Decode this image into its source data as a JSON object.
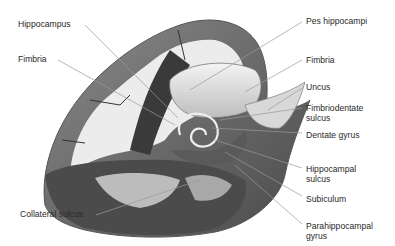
{
  "figure": {
    "colors": {
      "gray_matter": "#6f6f6f",
      "dark_matter": "#3a3a3a",
      "white_matter": "#e6e6e6",
      "leader_line": "#9a9a9a",
      "label_text": "#2a2a2a"
    },
    "labels_left": [
      {
        "id": "hippocampus",
        "text": "Hippocampus"
      },
      {
        "id": "fimbria-left",
        "text": "Fimbria"
      },
      {
        "id": "collateral-sulcus",
        "text": "Collateral sulcus"
      }
    ],
    "labels_right": [
      {
        "id": "pes-hippocampi",
        "text": "Pes hippocampi"
      },
      {
        "id": "fimbria-right",
        "text": "Fimbria"
      },
      {
        "id": "uncus",
        "text": "Uncus"
      },
      {
        "id": "fimbriodentate-sulcus",
        "text": "Fimbriodentate\nsulcus"
      },
      {
        "id": "dentate-gyrus",
        "text": "Dentate gyrus"
      },
      {
        "id": "hippocampal-sulcus",
        "text": "Hippocampal\nsulcus"
      },
      {
        "id": "subiculum",
        "text": "Subiculum"
      },
      {
        "id": "parahippocampal-gyrus",
        "text": "Parahippocampal\ngyrus"
      }
    ]
  }
}
